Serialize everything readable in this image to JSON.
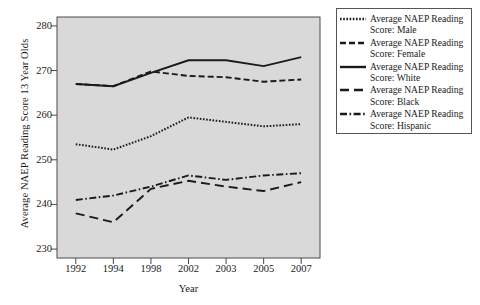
{
  "chart_data": {
    "type": "line",
    "title": "",
    "xlabel": "Year",
    "ylabel": "Average NAEP Reading Score 13 Year Olds",
    "categories": [
      "1992",
      "1994",
      "1998",
      "2002",
      "2003",
      "2005",
      "2007"
    ],
    "ylim": [
      228,
      282
    ],
    "yticks": [
      230,
      240,
      250,
      260,
      270,
      280
    ],
    "ytick_labels": [
      "230",
      "240",
      "250",
      "260",
      "270",
      "280"
    ],
    "grid": false,
    "legend_position": "right-outside",
    "plot_background": "#d9d9d9",
    "line_color": "#1a1a1a",
    "series": [
      {
        "name": "Average NAEP Reading Score: Male",
        "short": "Male",
        "style": "dotted",
        "values": [
          253.5,
          252.3,
          255.3,
          259.5,
          258.5,
          257.5,
          258.0
        ]
      },
      {
        "name": "Average NAEP Reading Score: Female",
        "short": "Female",
        "style": "dashed",
        "values": [
          267.0,
          266.5,
          269.8,
          268.8,
          268.5,
          267.5,
          268.0
        ]
      },
      {
        "name": "Average NAEP Reading Score: White",
        "short": "White",
        "style": "solid",
        "values": [
          267.0,
          266.5,
          269.5,
          272.3,
          272.3,
          271.0,
          273.0
        ]
      },
      {
        "name": "Average NAEP Reading Score: Black",
        "short": "Black",
        "style": "long-dash",
        "values": [
          238.0,
          236.0,
          243.5,
          245.3,
          244.0,
          243.0,
          245.0
        ]
      },
      {
        "name": "Average NAEP Reading Score: Hispanic",
        "short": "Hispanic",
        "style": "dash-dot",
        "values": [
          241.0,
          242.0,
          244.0,
          246.5,
          245.5,
          246.5,
          247.0
        ]
      }
    ]
  },
  "legend": {
    "entries": [
      {
        "line1": "Average NAEP Reading",
        "line2": "Score: Male"
      },
      {
        "line1": "Average NAEP Reading",
        "line2": "Score: Female"
      },
      {
        "line1": "Average NAEP Reading",
        "line2": "Score: White"
      },
      {
        "line1": "Average NAEP Reading",
        "line2": "Score: Black"
      },
      {
        "line1": "Average NAEP Reading",
        "line2": "Score: Hispanic"
      }
    ]
  }
}
